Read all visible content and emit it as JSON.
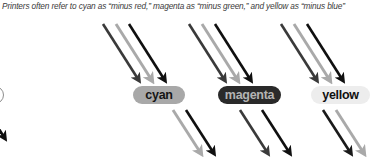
{
  "figure": {
    "caption": "Printers often refer to cyan as “minus red,” magenta as “minus green,” and yellow as “minus blue”",
    "background_color": "#ffffff"
  },
  "filters": [
    {
      "id": "cyan",
      "label": "cyan",
      "pill_fill": "#a8a8a8",
      "pill_text_color": "#151515",
      "incoming_rays": [
        {
          "name": "red-ray",
          "color": "#3a3a3a"
        },
        {
          "name": "green-ray",
          "color": "#a9a9a9"
        },
        {
          "name": "blue-ray",
          "color": "#101010"
        }
      ],
      "outgoing_rays": [
        {
          "name": "green-ray",
          "color": "#a9a9a9"
        },
        {
          "name": "blue-ray",
          "color": "#101010"
        }
      ]
    },
    {
      "id": "magenta",
      "label": "magenta",
      "pill_fill": "#2a2a2a",
      "pill_text_color": "#b4b4b4",
      "incoming_rays": [
        {
          "name": "red-ray",
          "color": "#3a3a3a"
        },
        {
          "name": "green-ray",
          "color": "#a9a9a9"
        },
        {
          "name": "blue-ray",
          "color": "#101010"
        }
      ],
      "outgoing_rays": [
        {
          "name": "red-ray",
          "color": "#3a3a3a"
        },
        {
          "name": "blue-ray",
          "color": "#101010"
        }
      ]
    },
    {
      "id": "yellow",
      "label": "yellow",
      "pill_fill": "#ededed",
      "pill_text_color": "#111111",
      "incoming_rays": [
        {
          "name": "red-ray",
          "color": "#3a3a3a"
        },
        {
          "name": "green-ray",
          "color": "#a9a9a9"
        },
        {
          "name": "blue-ray",
          "color": "#101010"
        }
      ],
      "outgoing_rays": [
        {
          "name": "red-ray",
          "color": "#1a1a1a"
        },
        {
          "name": "green-ray",
          "color": "#a9a9a9"
        }
      ]
    }
  ],
  "edge_artifacts": {
    "partial_pill_outline_color": "#8e8e8e",
    "partial_arrow_color": "#101010"
  }
}
